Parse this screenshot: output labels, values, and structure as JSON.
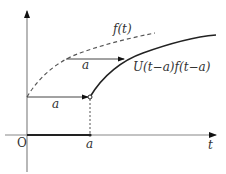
{
  "diagram": {
    "title": "",
    "labels": {
      "origin": "O",
      "t_axis": "t",
      "a_tick": "a",
      "shift_lower": "a",
      "shift_upper": "a",
      "f_curve": "f(t)",
      "shifted_curve": "U(t−a)f(t−a)"
    },
    "colors": {
      "axis": "#888888",
      "curve": "#222222",
      "dashed": "#555555"
    }
  }
}
